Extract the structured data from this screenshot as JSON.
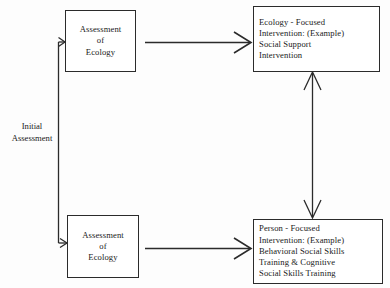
{
  "diagram": {
    "background_color": "#fdfdfd",
    "line_color": "#2b2b2b",
    "labels": {
      "initial_assessment": {
        "line1": "Initial",
        "line2": "Assessment"
      }
    },
    "boxes": [
      {
        "id": "assessment-ecology-top",
        "lines": [
          "Assessment",
          "of",
          "Ecology"
        ]
      },
      {
        "id": "assessment-ecology-bottom",
        "lines": [
          "Assessment",
          "of",
          "Ecology"
        ]
      },
      {
        "id": "ecology-focused-intervention",
        "lines": [
          "Ecology - Focused",
          "Intervention: (Example)",
          "Social Support",
          "Intervention"
        ]
      },
      {
        "id": "person-focused-intervention",
        "lines": [
          "Person - Focused",
          "Intervention: (Example)",
          "Behavioral Social Skills",
          "Training & Cognitive",
          "Social Skills Training"
        ]
      }
    ],
    "connectors": [
      {
        "id": "initial-assessment-branch",
        "type": "branching-line",
        "arrowheads": [
          "right-into-top-box",
          "right-into-bottom-box"
        ]
      },
      {
        "id": "top-assessment-to-ecology-intervention",
        "type": "horizontal-arrow",
        "arrowheads": [
          "right"
        ]
      },
      {
        "id": "bottom-assessment-to-person-intervention",
        "type": "horizontal-arrow",
        "arrowheads": [
          "right"
        ]
      },
      {
        "id": "intervention-bidirectional-link",
        "type": "vertical-arrow",
        "arrowheads": [
          "up",
          "down"
        ]
      }
    ]
  }
}
